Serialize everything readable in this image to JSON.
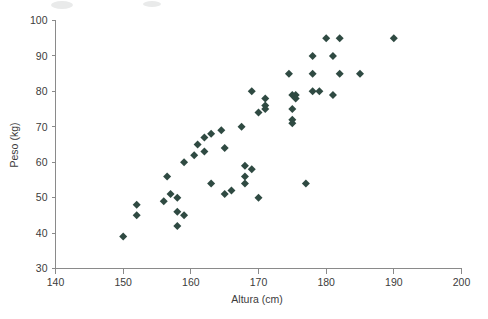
{
  "chart_data": {
    "type": "scatter",
    "title": "",
    "subtitle": "",
    "xlabel": "Altura (cm)",
    "ylabel": "Peso (kg)",
    "xlim": [
      140,
      200
    ],
    "ylim": [
      30,
      100
    ],
    "xticks": [
      140,
      150,
      160,
      170,
      180,
      190,
      200
    ],
    "yticks": [
      30,
      40,
      50,
      60,
      70,
      80,
      90,
      100
    ],
    "xtick_labels": [
      "140",
      "150",
      "160",
      "170",
      "180",
      "190",
      "200"
    ],
    "ytick_labels": [
      "30",
      "40",
      "50",
      "60",
      "70",
      "80",
      "90",
      "100"
    ],
    "grid": false,
    "legend": null,
    "legend_position": "none",
    "marker": "diamond",
    "marker_color": "#2f4a42",
    "marker_size": 4,
    "axis_color": "#8a8a8a",
    "text_color": "#3b3b3b",
    "background_color": "#ffffff",
    "series": [
      {
        "name": "",
        "points": [
          [
            150,
            39
          ],
          [
            152,
            48
          ],
          [
            152,
            45
          ],
          [
            156,
            49
          ],
          [
            156.5,
            56
          ],
          [
            157,
            51
          ],
          [
            158,
            50
          ],
          [
            158,
            46
          ],
          [
            158,
            42
          ],
          [
            159,
            45
          ],
          [
            159,
            60
          ],
          [
            160.5,
            62
          ],
          [
            161,
            65
          ],
          [
            162,
            67
          ],
          [
            162,
            63
          ],
          [
            163,
            68
          ],
          [
            163,
            54
          ],
          [
            164.5,
            69
          ],
          [
            165,
            64
          ],
          [
            165,
            51
          ],
          [
            166,
            52
          ],
          [
            167.5,
            70
          ],
          [
            168,
            59
          ],
          [
            168,
            56
          ],
          [
            168,
            54
          ],
          [
            169,
            80
          ],
          [
            169,
            58
          ],
          [
            170,
            74
          ],
          [
            170,
            50
          ],
          [
            171,
            78
          ],
          [
            171,
            76
          ],
          [
            171,
            75
          ],
          [
            174.5,
            85
          ],
          [
            175,
            79
          ],
          [
            175,
            75
          ],
          [
            175,
            72
          ],
          [
            175,
            71
          ],
          [
            175.5,
            79
          ],
          [
            175.5,
            78
          ],
          [
            177,
            54
          ],
          [
            178,
            90
          ],
          [
            178,
            85
          ],
          [
            178,
            80
          ],
          [
            179,
            80
          ],
          [
            180,
            95
          ],
          [
            181,
            90
          ],
          [
            181,
            79
          ],
          [
            182,
            95
          ],
          [
            182,
            85
          ],
          [
            185,
            85
          ],
          [
            190,
            95
          ]
        ]
      }
    ]
  },
  "figure": {
    "width": 488,
    "height": 319
  }
}
